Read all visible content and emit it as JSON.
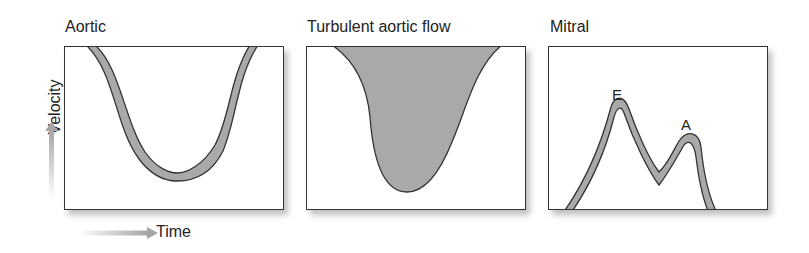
{
  "panels": [
    {
      "title": "Aortic"
    },
    {
      "title": "Turbulent aortic flow"
    },
    {
      "title": "Mitral",
      "peaks": {
        "E": "E",
        "A": "A"
      }
    }
  ],
  "axes": {
    "y_label": "Velocity",
    "x_label": "Time"
  },
  "colors": {
    "fill": "#a9a9a9",
    "stroke": "#333333",
    "arrow": "#b5b5b5"
  }
}
